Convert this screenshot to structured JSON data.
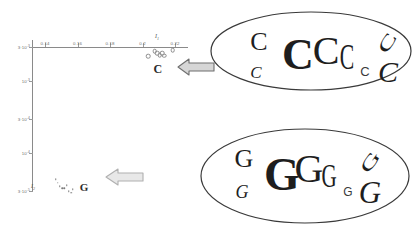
{
  "figure": {
    "background_color": "#ffffff",
    "axis_color": "#8a8a8a",
    "glyph_color": "#1e1e1e",
    "arrow_fill": "#d8d8d8",
    "arrow_stroke": "#7a7a7a",
    "arrow_fill_light": "#e6e6e6"
  },
  "chart_data": {
    "type": "scatter",
    "title": "",
    "xlabel": "I1",
    "ylabel": "I2",
    "xlabel_display": "I",
    "xlabel_sub": "1",
    "ylabel_display": "I",
    "ylabel_sub": "2",
    "xticks": [
      "0.14",
      "0.16",
      "0.18",
      "0.2",
      "0.22"
    ],
    "xtick_values": [
      0.14,
      0.16,
      0.18,
      0.2,
      0.22
    ],
    "yticks": [
      "3·10-3",
      "10-3",
      "3·10-4",
      "10-4",
      "3·10-5"
    ],
    "ytick_mantissa": [
      "3·10",
      "10",
      "3·10",
      "10",
      "3·10"
    ],
    "ytick_exponent": [
      "-3",
      "-3",
      "-4",
      "-4",
      "-5"
    ],
    "ytick_values": [
      0.003,
      0.001,
      0.0003,
      0.0001,
      3e-05
    ],
    "yscale": "log",
    "xlim": [
      0.132,
      0.228
    ],
    "ylim": [
      3e-05,
      0.003
    ],
    "grid": false,
    "legend": "none",
    "series": [
      {
        "name": "C",
        "label": "C",
        "marker": "open-circle",
        "points": [
          {
            "x": 0.2035,
            "y": 0.00225
          },
          {
            "x": 0.2075,
            "y": 0.0026
          },
          {
            "x": 0.209,
            "y": 0.00245
          },
          {
            "x": 0.2105,
            "y": 0.00232
          },
          {
            "x": 0.212,
            "y": 0.00248
          },
          {
            "x": 0.2135,
            "y": 0.00228
          },
          {
            "x": 0.2185,
            "y": 0.00272
          }
        ],
        "label_x": 0.2095,
        "label_y": 0.0015
      },
      {
        "name": "G",
        "label": "G",
        "marker": "dot",
        "points": [
          {
            "x": 0.1465,
            "y": 4.4e-05
          },
          {
            "x": 0.1478,
            "y": 3.92e-05
          },
          {
            "x": 0.1492,
            "y": 3.5e-05
          },
          {
            "x": 0.1505,
            "y": 3.3e-05
          },
          {
            "x": 0.1518,
            "y": 3.26e-05
          },
          {
            "x": 0.1535,
            "y": 3.62e-05
          },
          {
            "x": 0.1545,
            "y": 3e-05
          },
          {
            "x": 0.156,
            "y": 2.82e-05
          },
          {
            "x": 0.1572,
            "y": 3.18e-05
          }
        ],
        "label_x": 0.164,
        "label_y": 3.38e-05
      }
    ]
  },
  "callouts": [
    {
      "id": "callout-c",
      "letter": "C",
      "title": "C letterform variants",
      "glyphs": [
        {
          "char": "C",
          "style": "serif",
          "size": 26,
          "x": 51,
          "y": 33,
          "rotate": 0,
          "weight": "normal"
        },
        {
          "char": "C",
          "style": "serif-italic",
          "size": 17,
          "x": 48,
          "y": 63,
          "rotate": 0,
          "weight": "normal"
        },
        {
          "char": "C",
          "style": "serif-bold",
          "size": 44,
          "x": 90,
          "y": 46,
          "rotate": 0,
          "weight": "bold"
        },
        {
          "char": "C",
          "style": "serif",
          "size": 40,
          "x": 118,
          "y": 42,
          "rotate": 0,
          "weight": "normal"
        },
        {
          "char": "C",
          "style": "serif-narrow",
          "size": 35,
          "x": 139,
          "y": 48,
          "rotate": 0,
          "weight": "normal"
        },
        {
          "char": "C",
          "style": "sans",
          "size": 13,
          "x": 157,
          "y": 62,
          "rotate": 0,
          "weight": "normal"
        },
        {
          "char": "C",
          "style": "serif-rot",
          "size": 31,
          "x": 179,
          "y": 34,
          "rotate": -58,
          "weight": "normal"
        },
        {
          "char": "C",
          "style": "serif-italic",
          "size": 30,
          "x": 180,
          "y": 63,
          "rotate": 0,
          "weight": "normal"
        }
      ]
    },
    {
      "id": "callout-g",
      "letter": "G",
      "title": "G letterform variants",
      "glyphs": [
        {
          "char": "G",
          "style": "serif",
          "size": 26,
          "x": 46,
          "y": 33,
          "rotate": 0,
          "weight": "normal"
        },
        {
          "char": "G",
          "style": "serif-italic",
          "size": 18,
          "x": 44,
          "y": 66,
          "rotate": 0,
          "weight": "normal"
        },
        {
          "char": "G",
          "style": "serif-bold",
          "size": 46,
          "x": 84,
          "y": 49,
          "rotate": 0,
          "weight": "bold"
        },
        {
          "char": "G",
          "style": "serif",
          "size": 40,
          "x": 111,
          "y": 43,
          "rotate": 0,
          "weight": "normal"
        },
        {
          "char": "G",
          "style": "serif-narrow",
          "size": 34,
          "x": 131,
          "y": 50,
          "rotate": 0,
          "weight": "normal"
        },
        {
          "char": "G",
          "style": "sans",
          "size": 12,
          "x": 150,
          "y": 66,
          "rotate": 0,
          "weight": "normal"
        },
        {
          "char": "G",
          "style": "serif-rot",
          "size": 31,
          "x": 172,
          "y": 36,
          "rotate": -55,
          "weight": "normal"
        },
        {
          "char": "G",
          "style": "serif-italic",
          "size": 31,
          "x": 172,
          "y": 66,
          "rotate": 0,
          "weight": "normal"
        }
      ]
    }
  ],
  "arrows": [
    {
      "id": "arrow-c",
      "direction": "left",
      "tone": "dark"
    },
    {
      "id": "arrow-g",
      "direction": "left",
      "tone": "light"
    }
  ]
}
